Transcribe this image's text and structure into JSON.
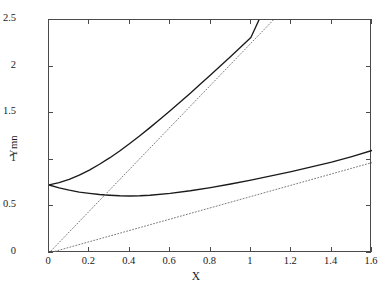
{
  "chart_data": {
    "type": "line",
    "title": "",
    "xlabel": "X",
    "ylabel": "Ymn",
    "xlim": [
      0,
      1.6
    ],
    "ylim": [
      0,
      2.5
    ],
    "xticks": [
      0,
      0.2,
      0.4,
      0.6,
      0.8,
      1,
      1.2,
      1.4,
      1.6
    ],
    "xticklabels": [
      "0",
      "0.2",
      "0.4",
      "0.6",
      "0.8",
      "1",
      "1.2",
      "1.4",
      "1.6"
    ],
    "yticks": [
      0,
      0.5,
      1,
      1.5,
      2,
      2.5
    ],
    "yticklabels": [
      "0",
      "0.5",
      "1",
      "1.5",
      "2",
      "2.5"
    ],
    "grid": false,
    "legend": null,
    "series": [
      {
        "name": "upper-solid-curve",
        "style": "solid",
        "color": "#1a1a1a",
        "x": [
          0,
          0.05,
          0.1,
          0.15,
          0.2,
          0.25,
          0.3,
          0.35,
          0.4,
          0.45,
          0.5,
          0.55,
          0.6,
          0.65,
          0.7,
          0.75,
          0.8,
          0.85,
          0.9,
          0.95,
          1.0,
          1.04
        ],
        "y": [
          0.73,
          0.755,
          0.79,
          0.835,
          0.89,
          0.952,
          1.02,
          1.095,
          1.175,
          1.258,
          1.345,
          1.434,
          1.526,
          1.62,
          1.715,
          1.812,
          1.91,
          2.009,
          2.109,
          2.21,
          2.312,
          2.5
        ]
      },
      {
        "name": "lower-solid-curve",
        "style": "solid",
        "color": "#1a1a1a",
        "x": [
          0,
          0.05,
          0.1,
          0.15,
          0.2,
          0.25,
          0.3,
          0.35,
          0.4,
          0.45,
          0.5,
          0.6,
          0.7,
          0.8,
          0.9,
          1.0,
          1.1,
          1.2,
          1.3,
          1.4,
          1.5,
          1.6
        ],
        "y": [
          0.73,
          0.699,
          0.674,
          0.654,
          0.64,
          0.628,
          0.62,
          0.614,
          0.612,
          0.614,
          0.62,
          0.64,
          0.668,
          0.702,
          0.74,
          0.782,
          0.827,
          0.874,
          0.924,
          0.975,
          1.035,
          1.1
        ]
      },
      {
        "name": "steep-dotted-line",
        "style": "dotted",
        "color": "#7a7a7a",
        "x": [
          0,
          1.111
        ],
        "y": [
          0,
          2.5
        ]
      },
      {
        "name": "shallow-dotted-line",
        "style": "dotted",
        "color": "#7a7a7a",
        "x": [
          0,
          1.6
        ],
        "y": [
          0,
          0.97
        ]
      }
    ]
  }
}
